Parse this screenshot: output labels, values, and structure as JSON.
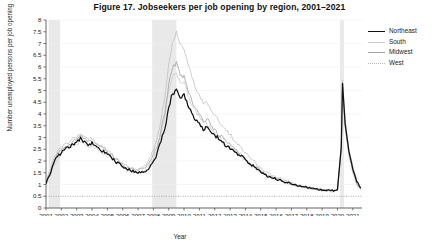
{
  "figure": {
    "title": "Figure 17.  Jobseekers per job opening by region, 2001–2021"
  },
  "axes": {
    "xlabel": "Year",
    "ylabel": "Number unemployed persons per job opening",
    "ytick_labels": [
      "0",
      "0.5",
      "1",
      "1.5",
      "2",
      "2.5",
      "3",
      "3.5",
      "4",
      "4.5",
      "5",
      "5.5",
      "6",
      "6.5",
      "7",
      "7.5",
      "8"
    ],
    "xtick_labels": [
      "2001",
      "2002",
      "2003",
      "2004",
      "2005",
      "2006",
      "2007",
      "2008",
      "2009",
      "2010",
      "2011",
      "2012",
      "2013",
      "2014",
      "2015",
      "2016",
      "2017",
      "2018",
      "2019",
      "2020",
      "2021"
    ]
  },
  "legend": {
    "items": [
      {
        "label": "Northeast",
        "color": "#111111",
        "width": 1.9,
        "dash": "none"
      },
      {
        "label": "South",
        "color": "#cfcfcf",
        "width": 1.2,
        "dash": "none"
      },
      {
        "label": "Midwest",
        "color": "#a6a6a6",
        "width": 1.2,
        "dash": "none"
      },
      {
        "label": "West",
        "color": "#bdbdbd",
        "width": 1.1,
        "dash": "dotted"
      }
    ]
  },
  "chart_data": {
    "type": "line",
    "title": "Figure 17.  Jobseekers per job opening by region, 2001–2021",
    "xlabel": "Year",
    "ylabel": "Number unemployed persons per job opening",
    "xlim": [
      2001,
      2021.6
    ],
    "ylim": [
      0,
      8
    ],
    "ytick_step": 0.5,
    "xtick_step": 1,
    "grid": "faint-horizontal-at-integers",
    "legend_position": "outside-right-top",
    "reference_lines": [
      {
        "y": 0.5,
        "style": "dotted",
        "color": "#9a9a9a"
      }
    ],
    "shaded_recessions": [
      {
        "label": "2001 recession",
        "x0": 2001.17,
        "x1": 2001.92,
        "color": "#e9e9e9"
      },
      {
        "label": "2007–2009 recession",
        "x0": 2007.92,
        "x1": 2009.5,
        "color": "#e9e9e9"
      },
      {
        "label": "2020 recession",
        "x0": 2020.17,
        "x1": 2020.42,
        "color": "#e9e9e9"
      }
    ],
    "x": [
      2001.0,
      2001.25,
      2001.5,
      2001.75,
      2002.0,
      2002.25,
      2002.5,
      2002.75,
      2003.0,
      2003.25,
      2003.5,
      2003.75,
      2004.0,
      2004.25,
      2004.5,
      2004.75,
      2005.0,
      2005.25,
      2005.5,
      2005.75,
      2006.0,
      2006.25,
      2006.5,
      2006.75,
      2007.0,
      2007.25,
      2007.5,
      2007.75,
      2008.0,
      2008.25,
      2008.5,
      2008.75,
      2009.0,
      2009.25,
      2009.5,
      2009.75,
      2010.0,
      2010.25,
      2010.5,
      2010.75,
      2011.0,
      2011.25,
      2011.5,
      2011.75,
      2012.0,
      2012.25,
      2012.5,
      2012.75,
      2013.0,
      2013.25,
      2013.5,
      2013.75,
      2014.0,
      2014.25,
      2014.5,
      2014.75,
      2015.0,
      2015.25,
      2015.5,
      2015.75,
      2016.0,
      2016.25,
      2016.5,
      2016.75,
      2017.0,
      2017.25,
      2017.5,
      2017.75,
      2018.0,
      2018.25,
      2018.5,
      2018.75,
      2019.0,
      2019.25,
      2019.5,
      2019.75,
      2020.0,
      2020.25,
      2020.33,
      2020.5,
      2020.75,
      2021.0,
      2021.25,
      2021.5
    ],
    "series": [
      {
        "name": "Northeast",
        "color": "#111111",
        "values": [
          1.0,
          1.45,
          1.9,
          2.2,
          2.35,
          2.5,
          2.6,
          2.75,
          2.8,
          2.95,
          2.8,
          2.7,
          2.75,
          2.6,
          2.5,
          2.4,
          2.3,
          2.15,
          2.0,
          1.9,
          1.75,
          1.65,
          1.6,
          1.55,
          1.5,
          1.55,
          1.6,
          1.75,
          2.0,
          2.3,
          2.8,
          3.4,
          4.3,
          4.9,
          5.05,
          4.6,
          4.8,
          4.35,
          4.0,
          3.7,
          3.55,
          3.3,
          3.5,
          3.2,
          3.05,
          2.95,
          2.8,
          2.65,
          2.55,
          2.45,
          2.3,
          2.2,
          2.05,
          1.9,
          1.8,
          1.65,
          1.55,
          1.45,
          1.35,
          1.3,
          1.25,
          1.2,
          1.15,
          1.1,
          1.05,
          1.0,
          0.95,
          0.92,
          0.9,
          0.85,
          0.82,
          0.8,
          0.78,
          0.76,
          0.75,
          0.74,
          0.78,
          2.6,
          5.3,
          3.6,
          2.4,
          1.7,
          1.15,
          0.9
        ]
      },
      {
        "name": "South",
        "color": "#cfcfcf",
        "values": [
          0.95,
          1.35,
          1.8,
          2.1,
          2.3,
          2.45,
          2.55,
          2.65,
          2.7,
          2.85,
          2.7,
          2.6,
          2.6,
          2.5,
          2.4,
          2.3,
          2.2,
          2.1,
          1.95,
          1.85,
          1.7,
          1.6,
          1.55,
          1.5,
          1.48,
          1.55,
          1.65,
          1.85,
          2.1,
          2.5,
          3.1,
          3.9,
          5.0,
          5.6,
          5.8,
          5.3,
          5.3,
          4.8,
          4.4,
          4.1,
          3.85,
          3.6,
          3.6,
          3.35,
          3.15,
          3.0,
          2.85,
          2.7,
          2.6,
          2.45,
          2.3,
          2.2,
          2.0,
          1.85,
          1.75,
          1.6,
          1.5,
          1.4,
          1.3,
          1.25,
          1.2,
          1.15,
          1.1,
          1.05,
          1.0,
          0.95,
          0.9,
          0.88,
          0.85,
          0.82,
          0.8,
          0.78,
          0.75,
          0.73,
          0.72,
          0.7,
          0.75,
          2.5,
          5.1,
          3.4,
          2.2,
          1.5,
          1.0,
          0.75
        ]
      },
      {
        "name": "Midwest",
        "color": "#a6a6a6",
        "values": [
          1.05,
          1.5,
          1.95,
          2.3,
          2.45,
          2.6,
          2.7,
          2.85,
          2.9,
          3.1,
          2.9,
          2.8,
          2.85,
          2.7,
          2.6,
          2.5,
          2.4,
          2.25,
          2.1,
          2.0,
          1.85,
          1.75,
          1.7,
          1.65,
          1.6,
          1.65,
          1.75,
          1.95,
          2.25,
          2.65,
          3.3,
          4.1,
          5.3,
          6.0,
          6.2,
          5.6,
          5.6,
          5.0,
          4.6,
          4.25,
          4.0,
          3.75,
          3.8,
          3.5,
          3.3,
          3.15,
          3.0,
          2.8,
          2.7,
          2.55,
          2.4,
          2.3,
          2.1,
          1.95,
          1.8,
          1.7,
          1.55,
          1.45,
          1.35,
          1.3,
          1.25,
          1.2,
          1.12,
          1.08,
          1.02,
          0.97,
          0.92,
          0.9,
          0.86,
          0.83,
          0.8,
          0.78,
          0.76,
          0.74,
          0.72,
          0.71,
          0.76,
          2.55,
          5.2,
          3.5,
          2.3,
          1.6,
          1.05,
          0.8
        ]
      },
      {
        "name": "West",
        "color": "#bdbdbd",
        "dash": "dotted",
        "values": [
          1.1,
          1.6,
          2.05,
          2.4,
          2.55,
          2.7,
          2.8,
          2.95,
          3.0,
          3.2,
          3.0,
          2.9,
          2.95,
          2.8,
          2.7,
          2.55,
          2.45,
          2.3,
          2.15,
          2.05,
          1.9,
          1.8,
          1.7,
          1.65,
          1.62,
          1.7,
          1.85,
          2.1,
          2.45,
          2.95,
          3.7,
          4.7,
          6.2,
          7.1,
          7.5,
          6.9,
          6.8,
          6.1,
          5.6,
          5.1,
          4.8,
          4.5,
          4.55,
          4.2,
          3.95,
          3.75,
          3.5,
          3.3,
          3.1,
          2.9,
          2.7,
          2.55,
          2.35,
          2.15,
          2.0,
          1.85,
          1.7,
          1.55,
          1.45,
          1.38,
          1.3,
          1.25,
          1.18,
          1.12,
          1.06,
          1.0,
          0.95,
          0.92,
          0.88,
          0.85,
          0.82,
          0.8,
          0.78,
          0.76,
          0.74,
          0.73,
          0.78,
          2.7,
          5.45,
          3.7,
          2.45,
          1.75,
          1.2,
          0.85
        ]
      }
    ]
  }
}
